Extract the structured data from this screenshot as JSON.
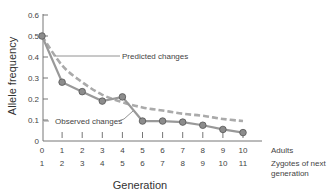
{
  "chart_data": {
    "type": "line",
    "title": "",
    "xlabel": "Generation",
    "ylabel": "Allele frequency",
    "ylim": [
      0,
      0.6
    ],
    "yticks": [
      0,
      0.1,
      0.2,
      0.3,
      0.4,
      0.5,
      0.6
    ],
    "ytick_labels": [
      "0",
      "0.1",
      "0.2",
      "0.3",
      "0.4",
      "0.5",
      "0.6"
    ],
    "x": [
      0,
      1,
      2,
      3,
      4,
      5,
      6,
      7,
      8,
      9,
      10
    ],
    "xtick_rows": [
      {
        "name": "Adults",
        "labels": [
          "0",
          "1",
          "2",
          "3",
          "4",
          "5",
          "6",
          "7",
          "8",
          "9",
          "10"
        ]
      },
      {
        "name": "Zygotes of next generation",
        "labels": [
          "1",
          "2",
          "3",
          "4",
          "5",
          "6",
          "7",
          "8",
          "9",
          "10",
          "11"
        ]
      }
    ],
    "series": [
      {
        "name": "Observed changes",
        "style": "solid-markers",
        "color": "#999999",
        "values": [
          0.5,
          0.28,
          0.235,
          0.19,
          0.21,
          0.095,
          0.095,
          0.09,
          0.075,
          0.055,
          0.04
        ]
      },
      {
        "name": "Predicted changes",
        "style": "dashed",
        "color": "#aaaaaa",
        "values": [
          0.5,
          0.36,
          0.28,
          0.22,
          0.185,
          0.16,
          0.145,
          0.13,
          0.12,
          0.105,
          0.095
        ]
      }
    ],
    "annotations": [
      {
        "text": "Predicted changes",
        "target_series": "Predicted changes"
      },
      {
        "text": "Observed changes",
        "target_series": "Observed changes"
      }
    ],
    "grid": false,
    "legend": "none (inline annotations)"
  },
  "labels": {
    "xlabel": "Generation",
    "ylabel": "Allele frequency",
    "row1_name": "Adults",
    "row2_name_line1": "Zygotes of next",
    "row2_name_line2": "generation",
    "predicted": "Predicted changes",
    "observed": "Observed changes"
  }
}
